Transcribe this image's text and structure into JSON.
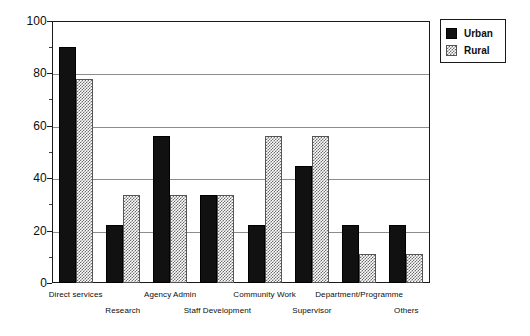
{
  "chart_data": {
    "type": "bar",
    "title": "",
    "xlabel": "",
    "ylabel": "",
    "ylim": [
      0,
      100
    ],
    "grid": true,
    "legend_position": "top-right",
    "y_ticks": [
      0,
      20,
      40,
      60,
      80,
      100
    ],
    "y_minor_ticks": [
      10,
      30,
      50,
      70,
      90
    ],
    "categories": [
      "Direct services",
      "Research",
      "Agency Admin",
      "Staff Development",
      "Community Work",
      "Supervisor",
      "Department/Programme",
      "Others"
    ],
    "series": [
      {
        "name": "Urban",
        "color": "#111111",
        "values": [
          90,
          22,
          56,
          33.5,
          22,
          44.5,
          22,
          22
        ]
      },
      {
        "name": "Rural",
        "color": "#6e6e6e",
        "values": [
          78,
          33.5,
          33.5,
          33.5,
          56,
          56,
          11,
          11
        ]
      }
    ]
  },
  "legend": {
    "items": [
      {
        "label": "Urban",
        "pattern": "solid-black"
      },
      {
        "label": "Rural",
        "pattern": "stipple-gray"
      }
    ]
  },
  "axis": {
    "y_labels": [
      "100",
      "80",
      "60",
      "40",
      "20",
      "0"
    ]
  }
}
